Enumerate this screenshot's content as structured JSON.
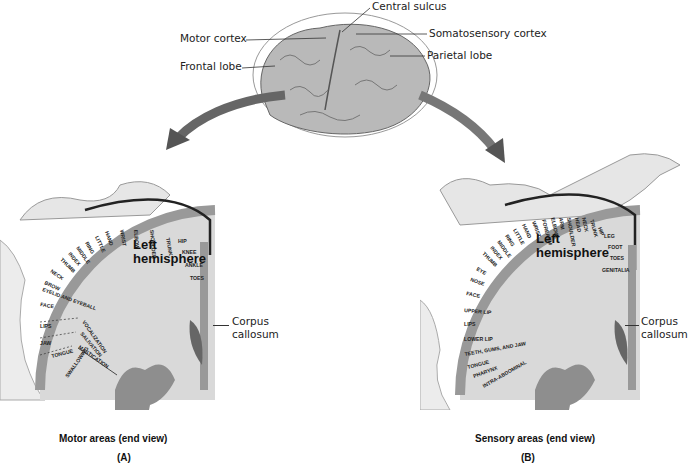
{
  "top": {
    "labels": {
      "central_sulcus": "Central sulcus",
      "motor_cortex": "Motor cortex",
      "somatosensory_cortex": "Somatosensory cortex",
      "frontal_lobe": "Frontal lobe",
      "parietal_lobe": "Parietal lobe"
    }
  },
  "panel_a": {
    "hemisphere_label_1": "Left",
    "hemisphere_label_2": "hemisphere",
    "corpus_1": "Corpus",
    "corpus_2": "callosum",
    "caption": "Motor areas (end view)",
    "letter": "(A)",
    "regions": [
      "TOES",
      "ANKLE",
      "KNEE",
      "HIP",
      "TRUNK",
      "SHOULDER",
      "ELBOW",
      "WRIST",
      "HAND",
      "LITTLE",
      "RING",
      "MIDDLE",
      "INDEX",
      "THUMB",
      "NECK",
      "BROW",
      "EYELID AND EYEBALL",
      "FACE",
      "LIPS",
      "JAW",
      "TONGUE",
      "SWALLOWING"
    ],
    "functions": [
      "VOCALIZATION",
      "SALIVATION",
      "MASTICATION"
    ]
  },
  "panel_b": {
    "hemisphere_label_1": "Left",
    "hemisphere_label_2": "hemisphere",
    "corpus_1": "Corpus",
    "corpus_2": "callosum",
    "caption": "Sensory areas (end view)",
    "letter": "(B)",
    "regions": [
      "GENITALIA",
      "TOES",
      "FOOT",
      "LEG",
      "HIP",
      "TRUNK",
      "NECK",
      "HEAD",
      "SHOULDER",
      "ARM",
      "ELBOW",
      "FOREARM",
      "WRIST",
      "HAND",
      "LITTLE",
      "RING",
      "MIDDLE",
      "INDEX",
      "THUMB",
      "EYE",
      "NOSE",
      "FACE",
      "UPPER LIP",
      "LIPS",
      "LOWER LIP",
      "TEETH, GUMS, AND JAW",
      "TONGUE",
      "PHARYNX",
      "INTRA-ABDOMINAL"
    ]
  }
}
